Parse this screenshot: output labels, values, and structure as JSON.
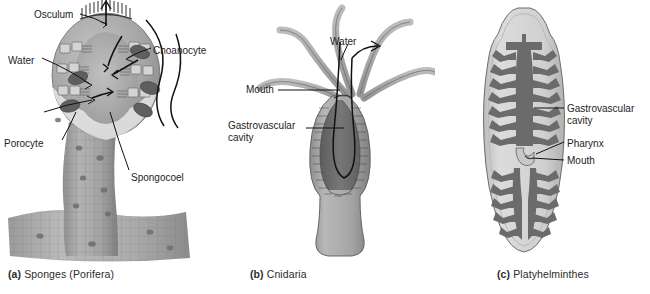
{
  "figure": {
    "background": "#ffffff",
    "ink": "#1d1d1d",
    "panels": [
      {
        "id": "a",
        "caption_tag": "(a)",
        "caption_text": "Sponges (Porifera)",
        "organism": "sponge",
        "labels": [
          {
            "name": "osculum",
            "text": "Osculum",
            "x": 34,
            "y": 9
          },
          {
            "name": "water",
            "text": "Water",
            "x": 8,
            "y": 55
          },
          {
            "name": "choanocyte",
            "text": "Choanocyte",
            "x": 153,
            "y": 45
          },
          {
            "name": "porocyte",
            "text": "Porocyte",
            "x": 4,
            "y": 138
          },
          {
            "name": "spongocoel",
            "text": "Spongocoel",
            "x": 131,
            "y": 172
          }
        ],
        "colors": {
          "body_light": "#c9c9c9",
          "body_mid": "#a8a8a8",
          "body_dark": "#8c8c8c",
          "cavity": "#b3b3b3",
          "choanocyte": "#6f6f6f",
          "outline": "#4a4a4a"
        }
      },
      {
        "id": "b",
        "caption_tag": "(b)",
        "caption_text": "Cnidaria",
        "organism": "hydra",
        "labels": [
          {
            "name": "water",
            "text": "Water",
            "x": 110,
            "y": 36
          },
          {
            "name": "mouth",
            "text": "Mouth",
            "x": 26,
            "y": 84
          },
          {
            "name": "gastrovascular-cavity",
            "text": "Gastrovascular\ncavity",
            "x": 8,
            "y": 120
          }
        ],
        "colors": {
          "body": "#a8a8a8",
          "body_light": "#bcbcbc",
          "cavity": "#707070",
          "tentacle": "#a5a5a5",
          "outline": "#4a4a4a"
        }
      },
      {
        "id": "c",
        "caption_tag": "(c)",
        "caption_text": "Platyhelminthes",
        "organism": "planarian",
        "labels": [
          {
            "name": "gastrovascular-cavity",
            "text": "Gastrovascular\ncavity",
            "x": 137,
            "y": 103
          },
          {
            "name": "pharynx",
            "text": "Pharynx",
            "x": 137,
            "y": 138
          },
          {
            "name": "mouth",
            "text": "Mouth",
            "x": 137,
            "y": 155
          }
        ],
        "colors": {
          "body": "#d2d2d2",
          "body_edge": "#b5b5b5",
          "cavity": "#6b6b6b",
          "pharynx": "#c4c4c4",
          "outline": "#5a5a5a"
        }
      }
    ]
  }
}
